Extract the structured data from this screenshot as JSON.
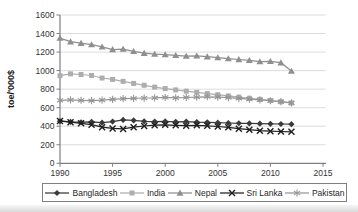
{
  "chart_data": {
    "type": "line",
    "title": "",
    "ylabel": "toe/'000$",
    "xlabel": "",
    "x_years": [
      1990,
      1991,
      1992,
      1993,
      1994,
      1995,
      1996,
      1997,
      1998,
      1999,
      2000,
      2001,
      2002,
      2003,
      2004,
      2005,
      2006,
      2007,
      2008,
      2009,
      2010,
      2011,
      2012
    ],
    "xlim": [
      1990,
      2015
    ],
    "ylim": [
      0,
      1600
    ],
    "xticks": [
      1990,
      1995,
      2000,
      2005,
      2010,
      2015
    ],
    "yticks": [
      0,
      200,
      400,
      600,
      800,
      1000,
      1200,
      1400,
      1600
    ],
    "grid": "horizontal",
    "legend_position": "bottom",
    "colors": {
      "axis": "#7f7f7f",
      "grid": "#dcdcdc",
      "tick_text": "#333333",
      "legend_border": "#7f7f7f",
      "background": "#ffffff"
    },
    "series": [
      {
        "name": "Bangladesh",
        "marker": "diamond",
        "color": "#3a3a3a",
        "values": [
          455,
          448,
          443,
          447,
          438,
          450,
          468,
          463,
          453,
          450,
          452,
          447,
          450,
          445,
          442,
          438,
          435,
          432,
          430,
          428,
          426,
          424,
          422
        ]
      },
      {
        "name": "India",
        "marker": "square",
        "color": "#adadad",
        "values": [
          945,
          965,
          958,
          947,
          920,
          905,
          884,
          862,
          842,
          822,
          806,
          792,
          778,
          765,
          752,
          740,
          727,
          714,
          701,
          689,
          677,
          664,
          651
        ]
      },
      {
        "name": "Nepal",
        "marker": "triangle",
        "color": "#8f8f8f",
        "values": [
          1350,
          1312,
          1296,
          1280,
          1256,
          1228,
          1232,
          1208,
          1188,
          1178,
          1172,
          1164,
          1157,
          1160,
          1150,
          1140,
          1130,
          1120,
          1110,
          1098,
          1100,
          1085,
          995
        ]
      },
      {
        "name": "Sri Lanka",
        "marker": "x",
        "color": "#1f1f1f",
        "values": [
          457,
          444,
          431,
          417,
          390,
          376,
          371,
          390,
          402,
          411,
          415,
          410,
          406,
          410,
          404,
          397,
          388,
          374,
          362,
          352,
          347,
          343,
          340
        ]
      },
      {
        "name": "Pakistan",
        "marker": "asterisk",
        "color": "#969696",
        "values": [
          680,
          684,
          680,
          676,
          681,
          690,
          698,
          701,
          704,
          706,
          710,
          706,
          710,
          714,
          718,
          714,
          708,
          700,
          692,
          684,
          675,
          665,
          652
        ]
      }
    ]
  }
}
